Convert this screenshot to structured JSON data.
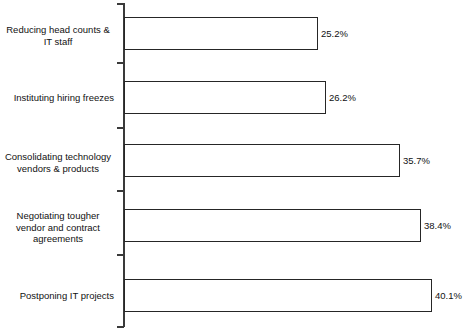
{
  "chart_data": {
    "type": "bar",
    "orientation": "horizontal",
    "title": "",
    "subtitle": "",
    "xlabel": "",
    "ylabel": "",
    "xlim": [
      0,
      45
    ],
    "grid": false,
    "legend": null,
    "value_suffix": "%",
    "categories": [
      "Reducing head counts &\nIT staff",
      "Instituting hiring freezes",
      "Consolidating technology\nvendors & products",
      "Negotiating tougher\nvendor and contract\nagreements",
      "Postponing IT projects"
    ],
    "values": [
      25.2,
      26.2,
      35.7,
      38.4,
      40.1
    ],
    "value_labels": [
      "25.2%",
      "26.2%",
      "35.7%",
      "38.4%",
      "40.1%"
    ],
    "colors": {
      "bar_fill": "#ffffff",
      "bar_stroke": "#262626",
      "axis": "#3a3a3a",
      "text": "#111111",
      "background": "#ffffff"
    }
  },
  "rows": [
    {
      "label": "Reducing head counts &\nIT staff",
      "value_label": "25.2%",
      "label_align": "center",
      "top": 17,
      "height": 33,
      "bar_width": 194,
      "label_top": 24,
      "value_left": 321,
      "value_top": 28,
      "tick_top": 62
    },
    {
      "label": "Instituting hiring freezes",
      "value_label": "26.2%",
      "label_align": "right",
      "top": 81,
      "height": 33,
      "bar_width": 202,
      "label_top": 92,
      "value_left": 329,
      "value_top": 92,
      "tick_top": 127
    },
    {
      "label": "Consolidating technology\nvendors & products",
      "value_label": "35.7%",
      "label_align": "center",
      "top": 144,
      "height": 33,
      "bar_width": 276,
      "label_top": 151,
      "value_left": 403,
      "value_top": 155,
      "tick_top": 190
    },
    {
      "label": "Negotiating tougher\nvendor and contract\nagreements",
      "value_label": "38.4%",
      "label_align": "center",
      "top": 209,
      "height": 33,
      "bar_width": 297,
      "label_top": 210,
      "value_left": 424,
      "value_top": 220,
      "tick_top": 254
    },
    {
      "label": "Postponing IT projects",
      "value_label": "40.1%",
      "label_align": "right",
      "top": 279,
      "height": 33,
      "bar_width": 308,
      "label_top": 290,
      "value_left": 435,
      "value_top": 290,
      "tick_top": 326
    }
  ]
}
